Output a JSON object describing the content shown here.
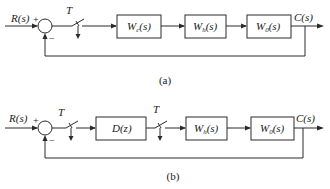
{
  "diagram_a": {
    "input_label": "R(s)",
    "plus_sign": "+",
    "minus_sign": "−",
    "sampler_label": "T",
    "blocks": [
      {
        "label": "W",
        "sub": "c",
        "arg": "(s)"
      },
      {
        "label": "W",
        "sub": "h",
        "arg": "(s)"
      },
      {
        "label": "W",
        "sub": "0",
        "arg": "(s)"
      }
    ],
    "output_label": "C(s)",
    "caption": "(a)"
  },
  "diagram_b": {
    "input_label": "R(s)",
    "plus_sign": "+",
    "minus_sign": "−",
    "sampler1_label": "T",
    "sampler2_label": "T",
    "blocks": [
      {
        "label": "D(z)",
        "sub": "",
        "arg": ""
      },
      {
        "label": "W",
        "sub": "h",
        "arg": "(s)"
      },
      {
        "label": "W",
        "sub": "0",
        "arg": "(s)"
      }
    ],
    "output_label": "C(s)",
    "caption": "(b)"
  }
}
